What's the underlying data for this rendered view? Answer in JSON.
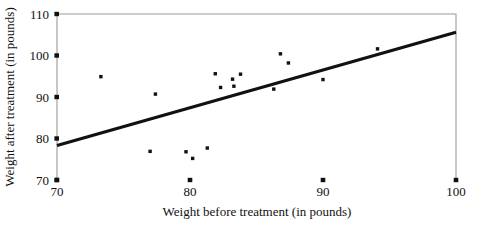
{
  "chart_data": {
    "type": "scatter",
    "title": "",
    "xlabel": "Weight before treatment (in pounds)",
    "ylabel": "Weight after treatment (in pounds)",
    "xlim": [
      70,
      100
    ],
    "ylim": [
      70,
      110
    ],
    "xticks": [
      70,
      80,
      90,
      100
    ],
    "yticks": [
      70,
      80,
      90,
      100,
      110
    ],
    "xtick_labels": [
      "70",
      "80",
      "90",
      "100"
    ],
    "ytick_labels": [
      "70",
      "80",
      "90",
      "100",
      "110"
    ],
    "grid": false,
    "legend": "none",
    "point_color": "#111111",
    "line_color": "#111111",
    "frame_color": "#9a9a9a",
    "points": [
      {
        "x": 73.3,
        "y": 94.9
      },
      {
        "x": 77.0,
        "y": 76.9
      },
      {
        "x": 77.4,
        "y": 90.7
      },
      {
        "x": 79.7,
        "y": 76.8
      },
      {
        "x": 80.2,
        "y": 75.2
      },
      {
        "x": 81.3,
        "y": 77.7
      },
      {
        "x": 81.9,
        "y": 95.6
      },
      {
        "x": 82.3,
        "y": 92.3
      },
      {
        "x": 83.2,
        "y": 94.3
      },
      {
        "x": 83.3,
        "y": 92.6
      },
      {
        "x": 83.8,
        "y": 95.5
      },
      {
        "x": 86.3,
        "y": 91.9
      },
      {
        "x": 86.8,
        "y": 100.4
      },
      {
        "x": 87.4,
        "y": 98.2
      },
      {
        "x": 90.0,
        "y": 94.2
      },
      {
        "x": 94.1,
        "y": 101.6
      }
    ],
    "trend_line": {
      "name": "regression-line",
      "x_start": 70,
      "y_start": 78.3,
      "x_end": 100,
      "y_end": 105.6
    }
  }
}
